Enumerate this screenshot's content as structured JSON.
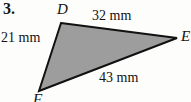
{
  "figure": {
    "problem_number": "3.",
    "shape": "triangle",
    "fill_color": "#9d9d9d",
    "stroke_color": "#111111",
    "background_color": "#fdfdfc",
    "text_color": "#131313",
    "vertices": [
      {
        "name": "D",
        "label": "D",
        "x": 61,
        "y": 23
      },
      {
        "name": "E",
        "label": "E",
        "x": 177,
        "y": 38
      },
      {
        "name": "F",
        "label": "F",
        "x": 39,
        "y": 91
      }
    ],
    "sides": [
      {
        "name": "DE",
        "label": "32 mm",
        "value": 32,
        "unit": "mm"
      },
      {
        "name": "DF",
        "label": "21 mm",
        "value": 21,
        "unit": "mm"
      },
      {
        "name": "EF",
        "label": "43 mm",
        "value": 43,
        "unit": "mm"
      }
    ]
  }
}
